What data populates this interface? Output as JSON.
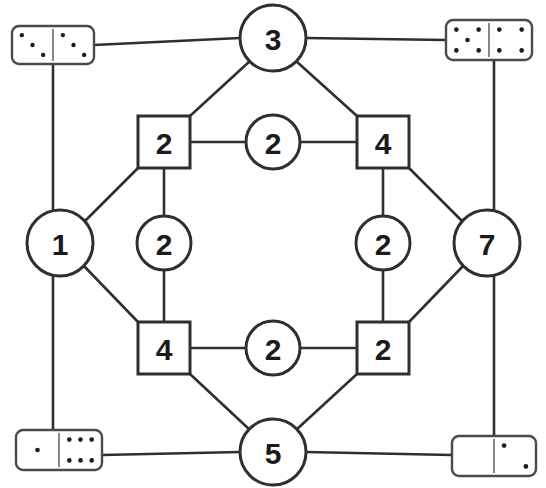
{
  "diagram": {
    "background_color": "#ffffff",
    "line_color": "#2f2f2f",
    "label_color": "#1b1b1b",
    "pip_color": "#1b1b1b",
    "width": 546,
    "height": 488
  },
  "nodes": {
    "outer_circles": [
      {
        "id": "top",
        "label": "3",
        "cx": 273,
        "cy": 38,
        "r": 33
      },
      {
        "id": "left",
        "label": "1",
        "cx": 60,
        "cy": 243,
        "r": 33
      },
      {
        "id": "right",
        "label": "7",
        "cx": 487,
        "cy": 243,
        "r": 33
      },
      {
        "id": "bottom",
        "label": "5",
        "cx": 273,
        "cy": 452,
        "r": 33
      }
    ],
    "squares": [
      {
        "id": "top-left",
        "label": "2",
        "x": 138,
        "y": 116,
        "size": 52
      },
      {
        "id": "top-right",
        "label": "4",
        "x": 357,
        "y": 116,
        "size": 52
      },
      {
        "id": "bottom-left",
        "label": "4",
        "x": 138,
        "y": 322,
        "size": 52
      },
      {
        "id": "bottom-right",
        "label": "2",
        "x": 357,
        "y": 322,
        "size": 52
      }
    ],
    "inner_circles": [
      {
        "id": "top-mid",
        "label": "2",
        "cx": 273,
        "cy": 142,
        "r": 27
      },
      {
        "id": "left-mid",
        "label": "2",
        "cx": 164,
        "cy": 243,
        "r": 27
      },
      {
        "id": "right-mid",
        "label": "2",
        "cx": 383,
        "cy": 243,
        "r": 27
      },
      {
        "id": "bottom-mid",
        "label": "2",
        "cx": 273,
        "cy": 348,
        "r": 27
      }
    ]
  },
  "dominoes": [
    {
      "id": "top-left-domino",
      "name": "domino-3-3",
      "x": 12,
      "y": 26,
      "width": 82,
      "height": 38,
      "left_pips": 3,
      "right_pips": 3
    },
    {
      "id": "top-right-domino",
      "name": "domino-5-4",
      "x": 446,
      "y": 20,
      "width": 86,
      "height": 40,
      "left_pips": 5,
      "right_pips": 4
    },
    {
      "id": "bottom-left-domino",
      "name": "domino-1-6",
      "x": 16,
      "y": 430,
      "width": 86,
      "height": 40,
      "left_pips": 1,
      "right_pips": 6
    },
    {
      "id": "bottom-right-domino",
      "name": "domino-0-2",
      "x": 452,
      "y": 436,
      "width": 84,
      "height": 40,
      "left_pips": 0,
      "right_pips": 2
    }
  ],
  "edges": [
    {
      "from": "top-left-domino",
      "to": "top",
      "path": "M 94,45 L 240,38"
    },
    {
      "from": "top",
      "to": "top-right-domino",
      "path": "M 306,38 L 446,40"
    },
    {
      "from": "top-left-domino",
      "to": "left",
      "path": "M 53,64 L 53,210"
    },
    {
      "from": "top-right-domino",
      "to": "right",
      "path": "M 494,60 L 494,210"
    },
    {
      "from": "left",
      "to": "bottom-left-domino",
      "path": "M 53,276 L 53,430"
    },
    {
      "from": "right",
      "to": "bottom-right-domino",
      "path": "M 494,276 L 494,436"
    },
    {
      "from": "bottom-left-domino",
      "to": "bottom",
      "path": "M 102,455 L 240,452"
    },
    {
      "from": "bottom",
      "to": "bottom-right-domino",
      "path": "M 306,452 L 452,455"
    },
    {
      "from": "top",
      "to": "top-left-square",
      "path": "M 250,61 L 190,116"
    },
    {
      "from": "top",
      "to": "top-right-square",
      "path": "M 296,61 L 357,116"
    },
    {
      "from": "top-left-square",
      "to": "left",
      "path": "M 138,168 L 83,223"
    },
    {
      "from": "top-right-square",
      "to": "right",
      "path": "M 409,168 L 464,223"
    },
    {
      "from": "left",
      "to": "bottom-left-square",
      "path": "M 83,265 L 138,322"
    },
    {
      "from": "right",
      "to": "bottom-right-square",
      "path": "M 464,265 L 409,322"
    },
    {
      "from": "bottom-left-square",
      "to": "bottom",
      "path": "M 190,374 L 250,430"
    },
    {
      "from": "bottom-right-square",
      "to": "bottom",
      "path": "M 357,374 L 296,430"
    },
    {
      "from": "top-left-square",
      "to": "top-mid",
      "path": "M 190,142 L 246,142"
    },
    {
      "from": "top-mid",
      "to": "top-right-square",
      "path": "M 300,142 L 357,142"
    },
    {
      "from": "top-left-square",
      "to": "left-mid",
      "path": "M 164,168 L 164,216"
    },
    {
      "from": "left-mid",
      "to": "bottom-left-square",
      "path": "M 164,270 L 164,322"
    },
    {
      "from": "top-right-square",
      "to": "right-mid",
      "path": "M 383,168 L 383,216"
    },
    {
      "from": "right-mid",
      "to": "bottom-right-square",
      "path": "M 383,270 L 383,322"
    },
    {
      "from": "bottom-left-square",
      "to": "bottom-mid",
      "path": "M 190,348 L 246,348"
    },
    {
      "from": "bottom-mid",
      "to": "bottom-right-square",
      "path": "M 300,348 L 357,348"
    }
  ]
}
